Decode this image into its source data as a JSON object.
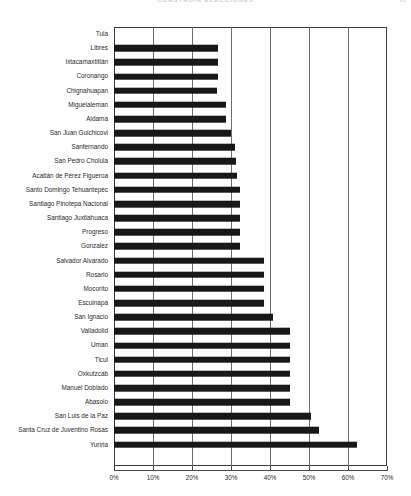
{
  "header": {
    "title": "CONSTRUIR ELECCIONES",
    "folio": "91"
  },
  "chart_data": {
    "type": "bar",
    "orientation": "horizontal",
    "title": "",
    "subtitle": "",
    "xlabel": "",
    "ylabel": "",
    "xlim": [
      0,
      70
    ],
    "xunit": "%",
    "xticks": [
      "0%",
      "10%",
      "20%",
      "30%",
      "40%",
      "50%",
      "60%",
      "70%"
    ],
    "xtick_values": [
      0,
      10,
      20,
      30,
      40,
      50,
      60,
      70
    ],
    "grid": true,
    "grid_axis": "x",
    "legend": "none",
    "bar_color": "#18181a",
    "categories": [
      "Tula",
      "Libres",
      "Ixtacamaxtitlán",
      "Coronango",
      "Chignahuapan",
      "Miguelaleman",
      "Aldama",
      "San Juan Guichicovi",
      "Sanfernando",
      "San Pedro Cholula",
      "Acatlán de Pérez Figueroa",
      "Santo Domingo Tehuantepec",
      "Santiago Pinotepa Nacional",
      "Santiago Juxtlahuaca",
      "Progreso",
      "Gonzalez",
      "Salvador Alvarado",
      "Rosario",
      "Mocorito",
      "Escuinapa",
      "San Ignacio",
      "Valladolid",
      "Uman",
      "Ticul",
      "Oxkutzcab",
      "Manuel Doblado",
      "Abasolo",
      "San Luis de la Paz",
      "Santa Cruz de Juventino Rosas",
      "Yuriria"
    ],
    "values": [
      0,
      26.7,
      26.7,
      26.7,
      26.5,
      28.8,
      28.8,
      30.0,
      31.0,
      31.3,
      31.5,
      32.3,
      32.3,
      32.3,
      32.3,
      32.3,
      38.5,
      38.5,
      38.5,
      38.5,
      40.8,
      45.0,
      45.0,
      45.0,
      45.0,
      45.0,
      45.0,
      50.5,
      52.5,
      62.3
    ]
  }
}
